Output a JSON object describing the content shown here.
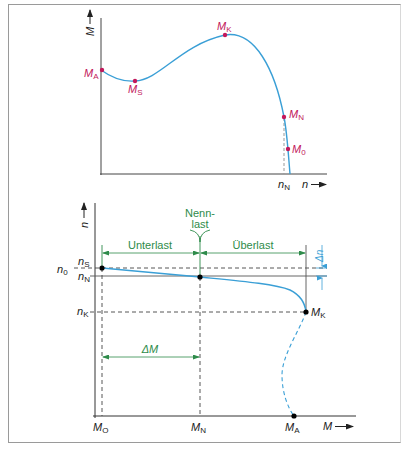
{
  "colors": {
    "curve": "#3a9fd6",
    "marker_top": "#c2185b",
    "label_top": "#c2185b",
    "marker_bottom": "#000000",
    "annotation_green": "#2e8b4a",
    "delta_n_blue": "#3a9fd6",
    "axis": "#333333",
    "frame": "#9a9a9a"
  },
  "top_chart": {
    "y_axis_label": "M",
    "x_axis_label": "n",
    "x_tick": {
      "main": "n",
      "sub": "N"
    },
    "points": [
      {
        "main": "M",
        "sub": "A",
        "role": "starting torque"
      },
      {
        "main": "M",
        "sub": "S",
        "role": "saddle torque"
      },
      {
        "main": "M",
        "sub": "K",
        "role": "breakdown torque"
      },
      {
        "main": "M",
        "sub": "N",
        "role": "rated torque"
      },
      {
        "main": "M",
        "sub": "0",
        "role": "no-load torque"
      }
    ]
  },
  "bottom_chart": {
    "y_axis_label": "n",
    "x_axis_label": "M",
    "y_ticks": [
      {
        "main": "n",
        "sub": "S"
      },
      {
        "main": "n",
        "sub": "0"
      },
      {
        "main": "n",
        "sub": "N"
      },
      {
        "main": "n",
        "sub": "K"
      }
    ],
    "x_ticks": [
      {
        "main": "M",
        "sub": "O"
      },
      {
        "main": "M",
        "sub": "N"
      },
      {
        "main": "M",
        "sub": "A"
      }
    ],
    "point_label_mk": {
      "main": "M",
      "sub": "K"
    },
    "annotations": {
      "nennlast_line1": "Nenn-",
      "nennlast_line2": "last",
      "unterlast": "Unterlast",
      "ueberlast": "Überlast",
      "delta_m": "ΔM",
      "delta_n": "Δn"
    }
  }
}
